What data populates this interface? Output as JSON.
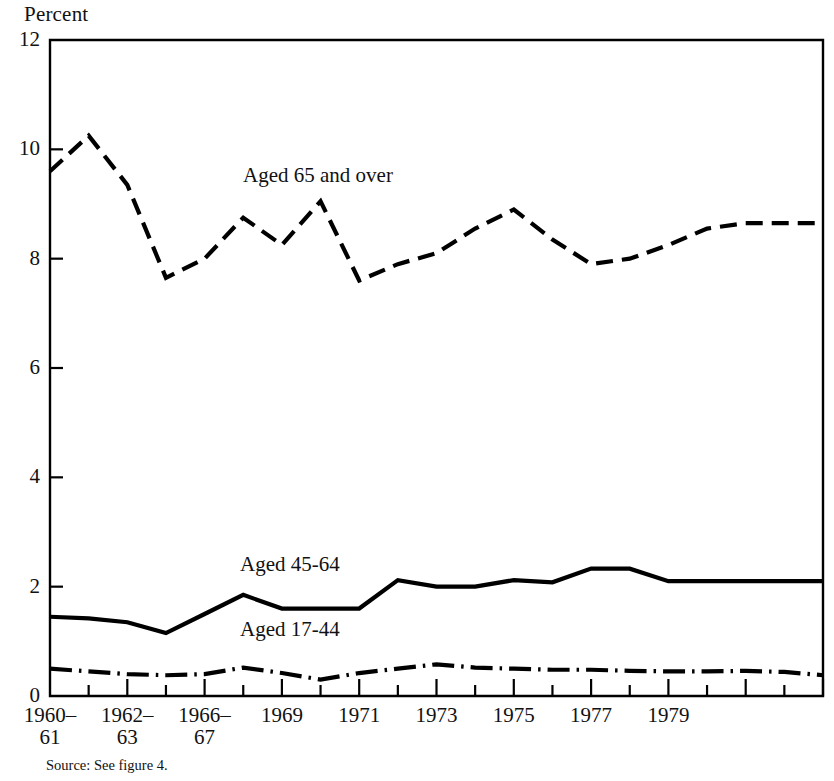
{
  "figure": {
    "y_axis_title": "Percent",
    "source_note": "Source:  See figure 4.",
    "ink_color": "#000000",
    "background_color": "#ffffff"
  },
  "chart_data": {
    "type": "line",
    "title": "",
    "subtitle": "",
    "xlabel": "",
    "ylabel": "Percent",
    "ylim": [
      0,
      12
    ],
    "xlim": [
      1960,
      1980
    ],
    "grid": false,
    "legend_position": "inline-annotations",
    "ytick_labels": [
      "0",
      "2",
      "4",
      "6",
      "8",
      "10",
      "12"
    ],
    "ytick_values": [
      0,
      2,
      4,
      6,
      8,
      10,
      12
    ],
    "xtick_labels": [
      {
        "line1": "1960–",
        "line2": "61",
        "value": 1960
      },
      {
        "line1": "1962–",
        "line2": "63",
        "value": 1962
      },
      {
        "line1": "1966–",
        "line2": "67",
        "value": 1964
      },
      {
        "line1": "1969",
        "line2": "",
        "value": 1966
      },
      {
        "line1": "1971",
        "line2": "",
        "value": 1968
      },
      {
        "line1": "1973",
        "line2": "",
        "value": 1970
      },
      {
        "line1": "1975",
        "line2": "",
        "value": 1972
      },
      {
        "line1": "1977",
        "line2": "",
        "value": 1974
      },
      {
        "line1": "1979",
        "line2": "",
        "value": 1976
      }
    ],
    "x": [
      0,
      1,
      2,
      3,
      4,
      5,
      6,
      7,
      8,
      9,
      10,
      11,
      12,
      13,
      14,
      15,
      16,
      17,
      18,
      19,
      20
    ],
    "series": [
      {
        "name": "Aged 65 and over",
        "label": "Aged 65 and over",
        "line_style": "dashed",
        "label_x": 243,
        "label_y": 163,
        "values": [
          9.6,
          10.25,
          9.35,
          7.65,
          8.0,
          8.75,
          8.25,
          9.05,
          7.6,
          7.9,
          8.1,
          8.55,
          8.9,
          8.35,
          7.9,
          8.0,
          8.25,
          8.55,
          8.65,
          8.65,
          8.65
        ]
      },
      {
        "name": "Aged 45-64",
        "label": "Aged 45-64",
        "line_style": "solid",
        "label_x": 240,
        "label_y": 552,
        "values": [
          1.45,
          1.42,
          1.35,
          1.15,
          1.5,
          1.85,
          1.6,
          1.6,
          1.6,
          2.12,
          2.0,
          2.0,
          2.12,
          2.08,
          2.33,
          2.33,
          2.1,
          2.1,
          2.1,
          2.1,
          2.1
        ]
      },
      {
        "name": "Aged 17-44",
        "label": "Aged 17-44",
        "line_style": "dash-dot",
        "label_x": 240,
        "label_y": 617,
        "values": [
          0.5,
          0.45,
          0.4,
          0.38,
          0.4,
          0.52,
          0.42,
          0.3,
          0.42,
          0.5,
          0.58,
          0.52,
          0.5,
          0.48,
          0.48,
          0.46,
          0.45,
          0.45,
          0.46,
          0.44,
          0.38
        ]
      }
    ]
  }
}
